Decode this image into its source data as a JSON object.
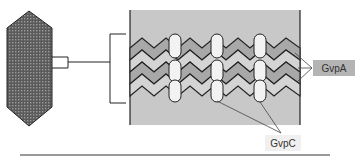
{
  "diagram": {
    "labels": {
      "gvpa": "GvpA",
      "gvpc": "GvpC"
    },
    "components": {
      "vesicle": "gas-vesicle-spindle",
      "wall_detail": "protein-wall-magnified",
      "ribs": "GvpA zigzag ribs",
      "crosslinks": "GvpC capsule columns"
    },
    "colors": {
      "background": "#ffffff",
      "panel_fill": "#c8c8c8",
      "rib_fill_dark": "#a8a8a8",
      "rib_fill_light": "#d4d4d4",
      "capsule_fill": "#f2f2f2",
      "stroke": "#222222",
      "gvpa_box": "#b4b4b4",
      "gvpc_box": "#f0f0f0"
    },
    "capsule_columns": 3,
    "rib_count": 4
  }
}
